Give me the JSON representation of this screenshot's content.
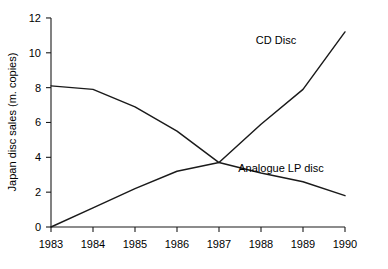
{
  "chart_data": {
    "type": "line",
    "title": "",
    "xlabel": "",
    "ylabel": "Japan disc sales (m. copies)",
    "categories": [
      "1983",
      "1984",
      "1985",
      "1986",
      "1987",
      "1988",
      "1989",
      "1990"
    ],
    "x": [
      1983,
      1984,
      1985,
      1986,
      1987,
      1988,
      1989,
      1990
    ],
    "xlim": [
      1983,
      1990
    ],
    "ylim": [
      0,
      12
    ],
    "yticks": [
      0,
      2,
      4,
      6,
      8,
      10,
      12
    ],
    "ytick_labels": [
      "0",
      "2",
      "4",
      "6",
      "8",
      "10",
      "12"
    ],
    "xtick_labels": [
      "1983",
      "1984",
      "1985",
      "1986",
      "1987",
      "1988",
      "1989",
      "1990"
    ],
    "grid": false,
    "legend_position": "inline-annotation",
    "series": [
      {
        "name": "CD Disc",
        "label": "CD Disc",
        "color": "#1a1a1a",
        "values": [
          0.0,
          1.1,
          2.2,
          3.2,
          3.7,
          5.9,
          7.9,
          11.2
        ]
      },
      {
        "name": "Analogue LP disc",
        "label": "Analogue LP disc",
        "color": "#1a1a1a",
        "values": [
          8.1,
          7.9,
          6.9,
          5.5,
          3.7,
          3.1,
          2.6,
          1.8
        ]
      }
    ],
    "annotations": [
      {
        "text": "CD Disc",
        "x_px": 276,
        "y_px": 44
      },
      {
        "text": "Analogue LP disc",
        "x_px": 281,
        "y_px": 172
      }
    ]
  },
  "axes": {
    "y_axis_title": "Japan disc sales (m. copies)",
    "origin_px": {
      "x": 51,
      "y": 227
    },
    "x_end_px": 345,
    "y_top_px": 18,
    "px_per_unit_y": 17.42,
    "px_per_category_x": 42
  },
  "colors": {
    "background": "#ffffff",
    "axis": "#1a1a1a",
    "series": "#1a1a1a",
    "text": "#000000"
  }
}
